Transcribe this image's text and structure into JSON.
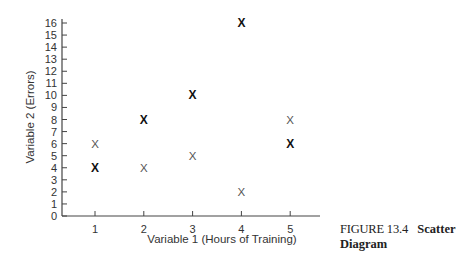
{
  "caption": {
    "figure_label": "FIGURE 13.4",
    "title_line1": "Scatter",
    "title_line2": "Diagram"
  },
  "chart_data": {
    "type": "scatter",
    "title": "",
    "xlabel": "Variable 1 (Hours of Training)",
    "ylabel": "Variable 2 (Errors)",
    "x_ticks": [
      1,
      2,
      3,
      4,
      5
    ],
    "y_ticks": [
      0,
      1,
      2,
      3,
      4,
      5,
      6,
      7,
      8,
      9,
      10,
      11,
      12,
      13,
      14,
      15,
      16
    ],
    "xlim": [
      0.3,
      5.6
    ],
    "ylim": [
      0,
      16
    ],
    "grid": false,
    "legend": null,
    "marker": "X",
    "series": [
      {
        "name": "bold",
        "style": "bold",
        "points": [
          [
            1,
            4
          ],
          [
            2,
            8
          ],
          [
            3,
            10
          ],
          [
            4,
            16
          ],
          [
            5,
            6
          ]
        ]
      },
      {
        "name": "light",
        "style": "light",
        "points": [
          [
            1,
            6
          ],
          [
            2,
            4
          ],
          [
            3,
            5
          ],
          [
            4,
            2
          ],
          [
            5,
            8
          ]
        ]
      }
    ]
  }
}
